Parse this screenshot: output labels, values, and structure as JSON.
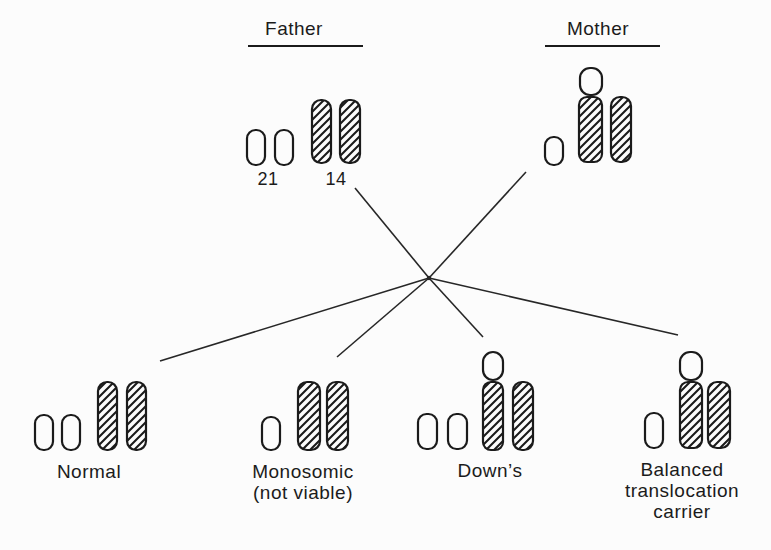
{
  "figure": {
    "colors": {
      "ink": "#1b1b1b",
      "paper": "#fcfcfc"
    }
  },
  "parents": {
    "father": {
      "label": "Father",
      "chromosome_labels": {
        "c21": "21",
        "c14": "14"
      },
      "chromosomes": [
        "21",
        "21",
        "14",
        "14"
      ]
    },
    "mother": {
      "label": "Mother",
      "chromosomes": [
        "21",
        "14/21 translocation",
        "14"
      ]
    }
  },
  "offspring": [
    {
      "id": "normal",
      "label_lines": [
        "Normal"
      ],
      "chromosomes": [
        "21",
        "21",
        "14",
        "14"
      ]
    },
    {
      "id": "monosomic",
      "label_lines": [
        "Monosomic",
        "(not viable)"
      ],
      "chromosomes": [
        "21",
        "14",
        "14"
      ]
    },
    {
      "id": "downs",
      "label_lines": [
        "Down’s"
      ],
      "chromosomes": [
        "21",
        "21",
        "14/21 translocation",
        "14"
      ]
    },
    {
      "id": "balanced-translocation-carrier",
      "label_lines": [
        "Balanced",
        "translocation",
        "carrier"
      ],
      "chromosomes": [
        "21",
        "14/21 translocation",
        "14"
      ]
    }
  ]
}
